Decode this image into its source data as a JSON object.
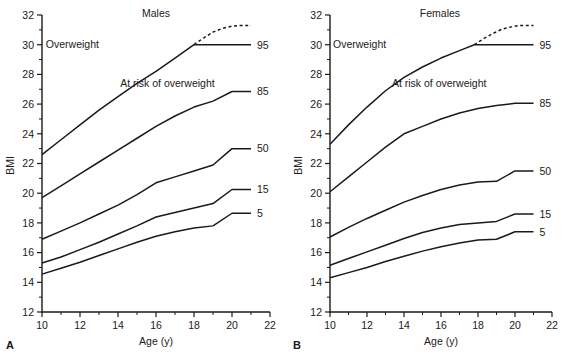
{
  "figure": {
    "background": "#ffffff",
    "ink": "#1a1a1a",
    "panel_letters": {
      "left": "A",
      "right": "B"
    }
  },
  "chart_data": [
    {
      "type": "line",
      "title": "Males",
      "panel_letter": "A",
      "xlabel": "Age (y)",
      "ylabel": "BMI",
      "xlim": [
        10,
        22
      ],
      "ylim": [
        12,
        32
      ],
      "xticks": [
        10,
        12,
        14,
        16,
        18,
        20,
        22
      ],
      "xticks_minor": [
        11,
        13,
        15,
        17,
        19,
        21
      ],
      "yticks": [
        12,
        14,
        16,
        18,
        20,
        22,
        24,
        26,
        28,
        30,
        32
      ],
      "ytick_labels": [
        "12",
        "14",
        "16",
        "18",
        "20",
        "22",
        "24",
        "26",
        "28",
        "30",
        "32"
      ],
      "grid": false,
      "legend_position": "right-of-line-ends",
      "annotations": [
        {
          "text": "Overweight",
          "x": 11.6,
          "y": 30.0
        },
        {
          "text": "At risk of overweight",
          "x": 16.6,
          "y": 27.4
        }
      ],
      "series": [
        {
          "name": "95",
          "label": "95",
          "style": "solid",
          "x": [
            10.0,
            11.0,
            12.0,
            13.0,
            14.0,
            15.0,
            16.0,
            17.0,
            18.0,
            19.0,
            20.0,
            21.0
          ],
          "y": [
            22.6,
            23.6,
            24.6,
            25.6,
            26.5,
            27.4,
            28.2,
            29.1,
            30.0,
            30.0,
            30.0,
            30.0
          ]
        },
        {
          "name": "95-dashed-extension",
          "label": "",
          "style": "dashed",
          "x": [
            18.0,
            18.5,
            19.0,
            19.5,
            20.0,
            20.5,
            21.0
          ],
          "y": [
            30.0,
            30.45,
            30.85,
            31.1,
            31.25,
            31.3,
            31.3
          ]
        },
        {
          "name": "85",
          "label": "85",
          "style": "solid",
          "x": [
            10.0,
            11.0,
            12.0,
            13.0,
            14.0,
            15.0,
            16.0,
            17.0,
            18.0,
            19.0,
            20.0,
            21.0
          ],
          "y": [
            19.7,
            20.5,
            21.3,
            22.1,
            22.9,
            23.7,
            24.5,
            25.2,
            25.8,
            26.2,
            26.85,
            26.85
          ]
        },
        {
          "name": "50",
          "label": "50",
          "style": "solid",
          "x": [
            10.0,
            11.0,
            12.0,
            13.0,
            14.0,
            15.0,
            16.0,
            17.0,
            18.0,
            19.0,
            20.0,
            21.0
          ],
          "y": [
            16.9,
            17.45,
            18.0,
            18.6,
            19.2,
            19.9,
            20.7,
            21.1,
            21.5,
            21.9,
            23.0,
            23.0
          ]
        },
        {
          "name": "15",
          "label": "15",
          "style": "solid",
          "x": [
            10.0,
            11.0,
            12.0,
            13.0,
            14.0,
            15.0,
            16.0,
            17.0,
            18.0,
            19.0,
            20.0,
            21.0
          ],
          "y": [
            15.3,
            15.7,
            16.2,
            16.7,
            17.25,
            17.8,
            18.4,
            18.7,
            19.0,
            19.3,
            20.25,
            20.25
          ]
        },
        {
          "name": "5",
          "label": "5",
          "style": "solid",
          "x": [
            10.0,
            11.0,
            12.0,
            13.0,
            14.0,
            15.0,
            16.0,
            17.0,
            18.0,
            19.0,
            20.0,
            21.0
          ],
          "y": [
            14.55,
            14.95,
            15.35,
            15.8,
            16.25,
            16.7,
            17.1,
            17.4,
            17.65,
            17.8,
            18.65,
            18.65
          ]
        }
      ]
    },
    {
      "type": "line",
      "title": "Females",
      "panel_letter": "B",
      "xlabel": "Age (y)",
      "ylabel": "BMI",
      "xlim": [
        10,
        22
      ],
      "ylim": [
        12,
        32
      ],
      "xticks": [
        10,
        12,
        14,
        16,
        18,
        20,
        22
      ],
      "xticks_minor": [
        11,
        13,
        15,
        17,
        19,
        21
      ],
      "yticks": [
        12,
        14,
        16,
        18,
        20,
        22,
        24,
        26,
        28,
        30,
        32
      ],
      "ytick_labels": [
        "12",
        "14",
        "16",
        "18",
        "20",
        "22",
        "24",
        "26",
        "28",
        "30",
        "32"
      ],
      "grid": false,
      "legend_position": "right-of-line-ends",
      "annotations": [
        {
          "text": "Overweight",
          "x": 11.6,
          "y": 30.0
        },
        {
          "text": "At risk of overweight",
          "x": 15.9,
          "y": 27.4
        }
      ],
      "series": [
        {
          "name": "95",
          "label": "95",
          "style": "solid",
          "x": [
            10.0,
            11.0,
            12.0,
            13.0,
            14.0,
            15.0,
            16.0,
            17.0,
            17.8,
            19.0,
            20.0,
            21.0
          ],
          "y": [
            23.3,
            24.6,
            25.8,
            26.9,
            27.8,
            28.5,
            29.1,
            29.6,
            30.0,
            30.0,
            30.0,
            30.0
          ]
        },
        {
          "name": "95-dashed-extension",
          "label": "",
          "style": "dashed",
          "x": [
            17.8,
            18.3,
            18.8,
            19.3,
            19.8,
            20.3,
            21.0
          ],
          "y": [
            30.0,
            30.4,
            30.75,
            31.05,
            31.2,
            31.3,
            31.3
          ]
        },
        {
          "name": "85",
          "label": "85",
          "style": "solid",
          "x": [
            10.0,
            11.0,
            12.0,
            13.0,
            14.0,
            15.0,
            16.0,
            17.0,
            18.0,
            19.0,
            20.0,
            21.0
          ],
          "y": [
            20.1,
            21.1,
            22.1,
            23.1,
            24.0,
            24.5,
            25.0,
            25.4,
            25.7,
            25.9,
            26.05,
            26.05
          ]
        },
        {
          "name": "50",
          "label": "50",
          "style": "solid",
          "x": [
            10.0,
            11.0,
            12.0,
            13.0,
            14.0,
            15.0,
            16.0,
            17.0,
            18.0,
            19.0,
            20.0,
            21.0
          ],
          "y": [
            17.05,
            17.7,
            18.3,
            18.85,
            19.4,
            19.85,
            20.25,
            20.55,
            20.75,
            20.8,
            21.5,
            21.5
          ]
        },
        {
          "name": "15",
          "label": "15",
          "style": "solid",
          "x": [
            10.0,
            11.0,
            12.0,
            13.0,
            14.0,
            15.0,
            16.0,
            17.0,
            18.0,
            19.0,
            20.0,
            21.0
          ],
          "y": [
            15.15,
            15.6,
            16.05,
            16.5,
            16.95,
            17.35,
            17.65,
            17.9,
            18.0,
            18.1,
            18.6,
            18.6
          ]
        },
        {
          "name": "5",
          "label": "5",
          "style": "solid",
          "x": [
            10.0,
            11.0,
            12.0,
            13.0,
            14.0,
            15.0,
            16.0,
            17.0,
            18.0,
            19.0,
            20.0,
            21.0
          ],
          "y": [
            14.3,
            14.65,
            15.0,
            15.4,
            15.75,
            16.1,
            16.4,
            16.65,
            16.85,
            16.9,
            17.4,
            17.4
          ]
        }
      ]
    }
  ]
}
